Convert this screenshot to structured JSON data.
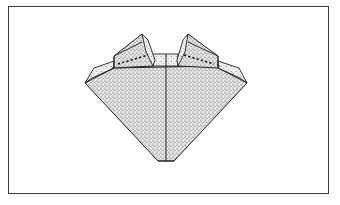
{
  "figure": {
    "type": "origami-diagram",
    "colors": {
      "frame": "#3a3a3a",
      "line": "#222222",
      "fill": "#dcdcdc",
      "stipple": "#555555",
      "background": "#ffffff"
    },
    "elements": [
      "outer-frame",
      "main-body",
      "center-crease",
      "left-ear-flap",
      "right-ear-flap",
      "left-dotted-fold-line",
      "right-dotted-fold-line",
      "top-center-band",
      "left-side-flap",
      "right-side-flap"
    ]
  }
}
